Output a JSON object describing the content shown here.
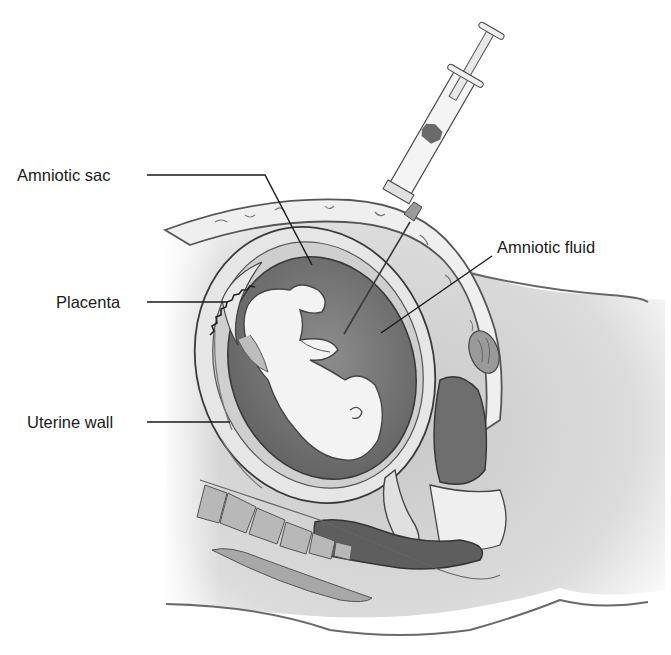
{
  "figure": {
    "style": "grayscale medical illustration, sagittal section of pregnant abdomen with syringe needle inserted into amniotic sac"
  },
  "labels": [
    {
      "id": "amniotic-sac",
      "text": "Amniotic sac",
      "x": 17,
      "y": 167
    },
    {
      "id": "placenta",
      "text": "Placenta",
      "x": 56,
      "y": 294
    },
    {
      "id": "uterine-wall",
      "text": "Uterine wall",
      "x": 27,
      "y": 414
    },
    {
      "id": "amniotic-fluid",
      "text": "Amniotic fluid",
      "x": 497,
      "y": 239
    }
  ],
  "colors": {
    "background": "#ffffff",
    "outline": "#3a3a3a",
    "fluid": "#7a7a7a",
    "fluid_dark": "#5e5e5e",
    "tissue_light": "#eeeeee",
    "tissue_mid": "#c4c4c4",
    "skin_shade": "#d3d3d3",
    "fetus": "#f3f3f3",
    "bowel_dark": "#6a6a6a",
    "text": "#1a1a1a"
  }
}
